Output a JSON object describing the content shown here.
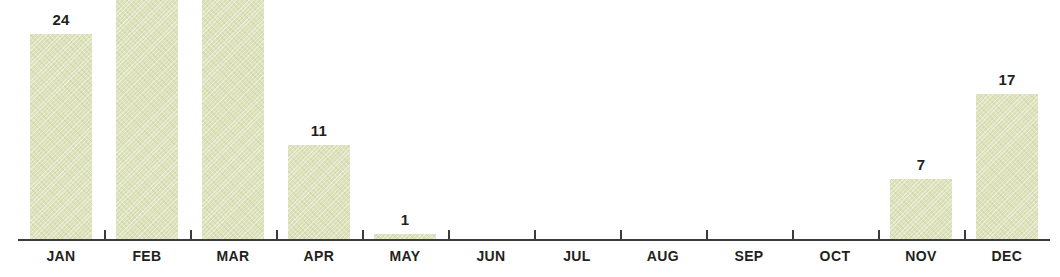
{
  "chart_data": {
    "type": "bar",
    "title": "",
    "subtitle": "",
    "xlabel": "",
    "ylabel": "",
    "ylim": [
      0,
      28
    ],
    "grid": false,
    "legend": null,
    "axis_line_color": "#3b3b3b",
    "bar_color": "#dde2bb",
    "label_color": "#231f20",
    "categories": [
      "JAN",
      "FEB",
      "MAR",
      "APR",
      "MAY",
      "JUN",
      "JUL",
      "AUG",
      "SEP",
      "OCT",
      "NOV",
      "DEC"
    ],
    "values": [
      24,
      28,
      28,
      11,
      1,
      0,
      0,
      0,
      0,
      0,
      7,
      17
    ],
    "value_labels": [
      "24",
      "28",
      "28",
      "11",
      "1",
      "",
      "",
      "",
      "",
      "",
      "7",
      "17"
    ]
  },
  "axis": {
    "tick_count": 11
  }
}
